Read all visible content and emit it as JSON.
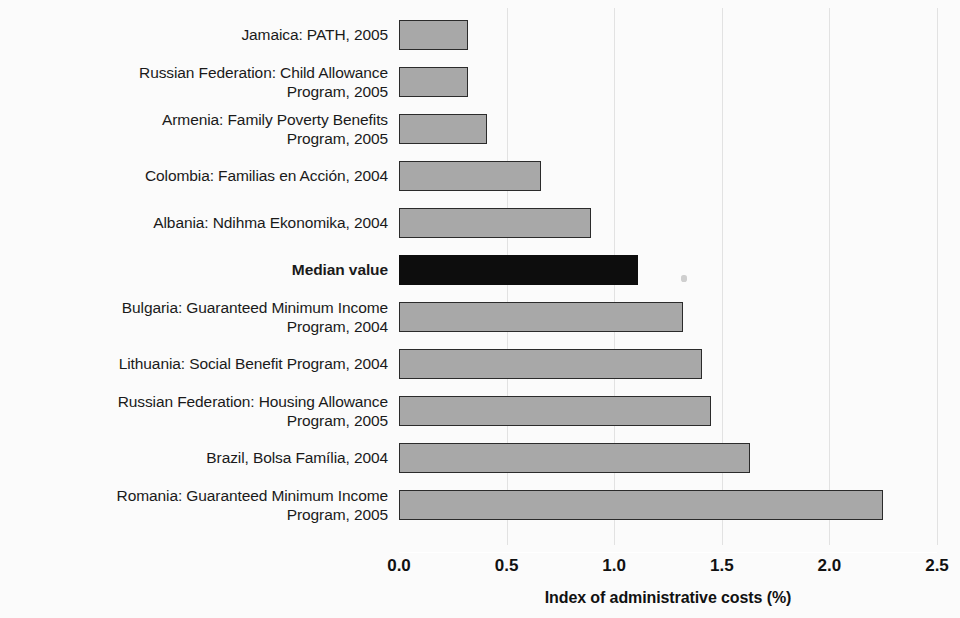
{
  "chart_data": {
    "type": "bar",
    "orientation": "horizontal",
    "title": "",
    "xlabel": "Index of administrative costs (%)",
    "ylabel": "",
    "xlim": [
      0.0,
      2.5
    ],
    "xticks": [
      "0.0",
      "0.5",
      "1.0",
      "1.5",
      "2.0",
      "2.5"
    ],
    "xtick_values": [
      0.0,
      0.5,
      1.0,
      1.5,
      2.0,
      2.5
    ],
    "grid": true,
    "legend": "none",
    "categories": [
      "Jamaica: PATH, 2005",
      "Russian Federation: Child Allowance Program, 2005",
      "Armenia: Family Poverty Benefits Program, 2005",
      "Colombia: Familias en Acción, 2004",
      "Albania: Ndihma Ekonomika, 2004",
      "Median value",
      "Bulgaria: Guaranteed Minimum Income Program, 2004",
      "Lithuania: Social Benefit Program, 2004",
      "Russian Federation: Housing Allowance Program, 2005",
      "Brazil, Bolsa Família, 2004",
      "Romania: Guaranteed Minimum Income Program, 2005"
    ],
    "values": [
      0.32,
      0.32,
      0.41,
      0.66,
      0.89,
      1.11,
      1.32,
      1.41,
      1.45,
      1.63,
      2.25
    ],
    "colors": {
      "bar_fill": "#a8a8a8",
      "bar_border": "#2b2b2b",
      "highlight_fill": "#0d0d0d",
      "gridline": "#e2e2e2",
      "background": "#fbfbfb",
      "text": "#1a1a1a"
    }
  },
  "rows": [
    {
      "label_line1": "Jamaica: PATH, 2005",
      "label_line2": "",
      "value": 0.32,
      "highlight": false
    },
    {
      "label_line1": "Russian Federation: Child Allowance",
      "label_line2": "Program, 2005",
      "value": 0.32,
      "highlight": false
    },
    {
      "label_line1": "Armenia: Family Poverty Benefits",
      "label_line2": "Program, 2005",
      "value": 0.41,
      "highlight": false
    },
    {
      "label_line1": "Colombia: Familias en Acción, 2004",
      "label_line2": "",
      "value": 0.66,
      "highlight": false
    },
    {
      "label_line1": "Albania: Ndihma Ekonomika, 2004",
      "label_line2": "",
      "value": 0.89,
      "highlight": false
    },
    {
      "label_line1": "Median value",
      "label_line2": "",
      "value": 1.11,
      "highlight": true
    },
    {
      "label_line1": "Bulgaria: Guaranteed Minimum Income",
      "label_line2": "Program, 2004",
      "value": 1.32,
      "highlight": false
    },
    {
      "label_line1": "Lithuania: Social Benefit Program, 2004",
      "label_line2": "",
      "value": 1.41,
      "highlight": false
    },
    {
      "label_line1": "Russian Federation: Housing Allowance",
      "label_line2": "Program, 2005",
      "value": 1.45,
      "highlight": false
    },
    {
      "label_line1": "Brazil, Bolsa Família, 2004",
      "label_line2": "",
      "value": 1.63,
      "highlight": false
    },
    {
      "label_line1": "Romania: Guaranteed Minimum Income",
      "label_line2": "Program, 2005",
      "value": 2.25,
      "highlight": false
    }
  ],
  "axis": {
    "title": "Index of administrative costs (%)",
    "ticks": [
      "0.0",
      "0.5",
      "1.0",
      "1.5",
      "2.0",
      "2.5"
    ]
  }
}
